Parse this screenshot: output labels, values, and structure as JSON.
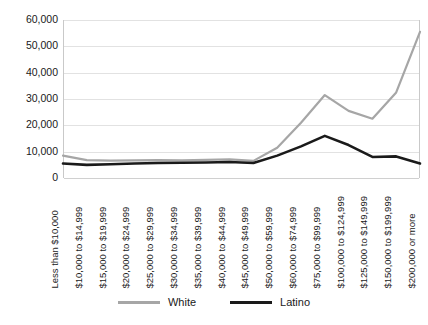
{
  "chart_data": {
    "type": "line",
    "title": "",
    "xlabel": "",
    "ylabel": "",
    "ylim": [
      0,
      60000
    ],
    "ytick_values": [
      0,
      10000,
      20000,
      30000,
      40000,
      50000,
      60000
    ],
    "ytick_labels": [
      "0",
      "10,000",
      "20,000",
      "30,000",
      "40,000",
      "50,000",
      "60,000"
    ],
    "grid": true,
    "legend_position": "bottom",
    "categories": [
      "Less than $10,000",
      "$10,000 to $14,999",
      "$15,000 to $19,999",
      "$20,000 to $24,999",
      "$25,000 to $29,999",
      "$30,000 to $34,999",
      "$35,000 to $39,999",
      "$40,000 to $44,999",
      "$45,000 to $49,999",
      "$50,000 to $59,999",
      "$60,000 to $74,999",
      "$75,000 to $99,999",
      "$100,000 to $124,999",
      "$125,000 to $149,999",
      "$150,000 to $199,999",
      "$200,000 or more"
    ],
    "series": [
      {
        "name": "White",
        "color": "#a6a6a6",
        "values": [
          8500,
          6800,
          6600,
          6700,
          6800,
          6700,
          6900,
          7100,
          6500,
          11500,
          21000,
          31500,
          25500,
          22500,
          32500,
          55500
        ]
      },
      {
        "name": "Latino",
        "color": "#1a1a1a",
        "values": [
          5500,
          5000,
          5200,
          5500,
          5700,
          5800,
          5900,
          6100,
          5700,
          8500,
          12000,
          16000,
          12500,
          8000,
          8200,
          5500
        ]
      }
    ]
  },
  "legend": {
    "items": [
      {
        "label": "White",
        "color": "#a6a6a6"
      },
      {
        "label": "Latino",
        "color": "#1a1a1a"
      }
    ]
  }
}
